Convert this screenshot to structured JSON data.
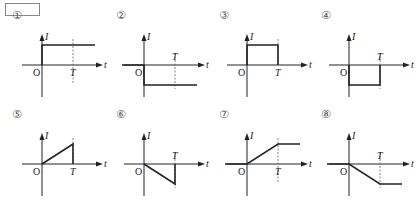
{
  "answer_box": "",
  "axis_labels": {
    "y": "I",
    "x": "t",
    "origin": "O",
    "period": "T"
  },
  "panels": [
    {
      "number": "①",
      "shape": "step-up-constant",
      "desc": "I jumps to positive constant at t=0 and stays constant beyond T"
    },
    {
      "number": "②",
      "shape": "step-down-constant",
      "desc": "I jumps to negative constant at t=0 and stays constant beyond T"
    },
    {
      "number": "③",
      "shape": "positive-pulse",
      "desc": "I positive constant from 0 to T, then zero"
    },
    {
      "number": "④",
      "shape": "negative-pulse",
      "desc": "I negative constant from 0 to T, then zero"
    },
    {
      "number": "⑤",
      "shape": "positive-ramp-pulse",
      "desc": "I increases linearly from 0 to T, then drops to zero"
    },
    {
      "number": "⑥",
      "shape": "negative-ramp-pulse",
      "desc": "I decreases linearly from 0 to T, then returns to zero"
    },
    {
      "number": "⑦",
      "shape": "positive-ramp-hold",
      "desc": "I increases linearly from 0 to T, then stays constant"
    },
    {
      "number": "⑧",
      "shape": "negative-ramp-hold",
      "desc": "I decreases linearly from 0 to T, then stays constant"
    }
  ],
  "colors": {
    "line": "#222222",
    "dashed": "#666666",
    "label": "#222222"
  }
}
